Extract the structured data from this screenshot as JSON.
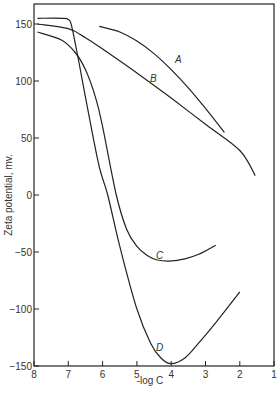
{
  "chart_data": {
    "type": "line",
    "title": "",
    "xlabel": "-log C",
    "ylabel": "Zeta potential, mv.",
    "xlim": [
      8,
      1
    ],
    "ylim": [
      -150,
      165
    ],
    "x_reversed": true,
    "grid": false,
    "legend": "inline curve labels",
    "x_ticks": [
      "8",
      "7",
      "6",
      "5",
      "4",
      "3",
      "2",
      "1"
    ],
    "y_ticks": [
      "150",
      "100",
      "50",
      "0",
      "-50",
      "-100",
      "-150"
    ],
    "series": [
      {
        "name": "A",
        "x": [
          6.1,
          5.5,
          5.0,
          4.5,
          4.0,
          3.5,
          3.0,
          2.45
        ],
        "values": [
          148,
          143,
          135,
          124,
          110,
          94,
          76,
          55
        ]
      },
      {
        "name": "B",
        "x": [
          7.9,
          7.0,
          6.5,
          6.0,
          5.0,
          4.0,
          3.0,
          2.0,
          1.55
        ],
        "values": [
          150,
          146,
          138,
          128,
          107,
          85,
          62,
          39,
          17
        ]
      },
      {
        "name": "C",
        "x": [
          7.9,
          7.2,
          6.8,
          6.5,
          6.2,
          6.0,
          5.6,
          5.3,
          5.0,
          4.7,
          4.4,
          4.05,
          3.6,
          3.2,
          2.7
        ],
        "values": [
          143,
          136,
          125,
          110,
          85,
          60,
          0,
          -30,
          -45,
          -53,
          -57,
          -58,
          -56,
          -52,
          -44
        ]
      },
      {
        "name": "D",
        "x": [
          7.9,
          7.2,
          7.0,
          6.9,
          6.7,
          6.4,
          6.1,
          5.85,
          5.5,
          5.0,
          4.6,
          4.3,
          4.0,
          3.6,
          3.2,
          2.7,
          2.0
        ],
        "values": [
          155,
          155,
          154,
          148,
          118,
          70,
          25,
          0,
          -45,
          -100,
          -130,
          -143,
          -148,
          -143,
          -130,
          -112,
          -85
        ]
      }
    ]
  },
  "labels": {
    "curve_a": "A",
    "curve_b": "B",
    "curve_c": "C",
    "curve_d": "D"
  }
}
